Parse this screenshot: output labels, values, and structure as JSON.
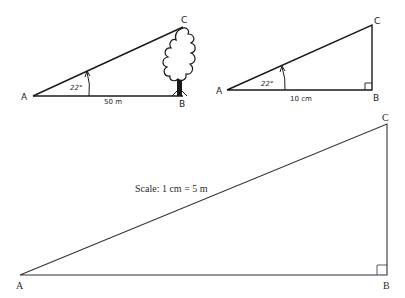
{
  "diagram": {
    "colors": {
      "stroke": "#1a1a1a",
      "background": "#ffffff"
    },
    "real_triangle": {
      "vertices": {
        "A": "A",
        "B": "B",
        "C": "C"
      },
      "angle_label": "22°",
      "base_label": "50 m",
      "object": "tree"
    },
    "sketch_triangle": {
      "vertices": {
        "A": "A",
        "B": "B",
        "C": "C"
      },
      "angle_label": "22°",
      "base_label": "10 cm",
      "right_angle_at": "B"
    },
    "scale_drawing": {
      "vertices": {
        "A": "A",
        "B": "B",
        "C": "C"
      },
      "scale_label": "Scale: 1 cm = 5 m",
      "right_angle_at": "B"
    }
  }
}
